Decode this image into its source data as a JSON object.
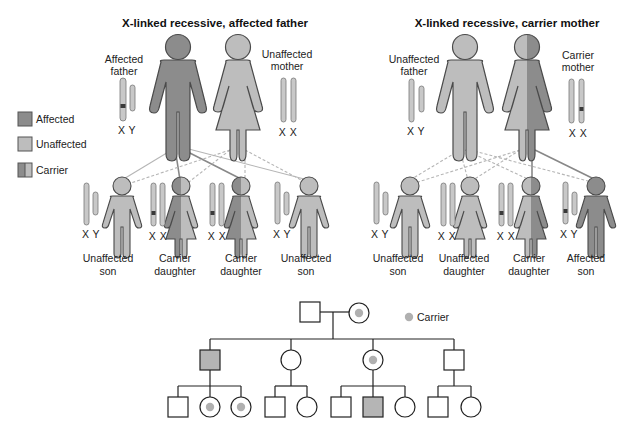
{
  "colors": {
    "affected": "#8c8c8c",
    "unaffected": "#bdbdbd",
    "carrier_dark": "#8c8c8c",
    "carrier_light": "#bdbdbd",
    "outline": "#4a4a4a",
    "chromosome": "#c8c8c8",
    "mutant_band": "#3a3a3a",
    "pedigree_line": "#222222",
    "pedigree_affected": "#b5b5b5",
    "pedigree_carrier_dot": "#b0b0b0"
  },
  "legend": {
    "items": [
      {
        "label": "Affected",
        "type": "affected"
      },
      {
        "label": "Unaffected",
        "type": "unaffected"
      },
      {
        "label": "Carrier",
        "type": "carrier"
      }
    ]
  },
  "panel_left": {
    "title": "X-linked recessive, affected father",
    "father": {
      "label_line1": "Affected",
      "label_line2": "father",
      "chromosomes": "X Y",
      "status": "affected"
    },
    "mother": {
      "label_line1": "Unaffected",
      "label_line2": "mother",
      "chromosomes": "X X",
      "status": "unaffected"
    },
    "children": [
      {
        "label_line1": "Unaffected",
        "label_line2": "son",
        "chromosomes": "X Y",
        "sex": "male",
        "status": "unaffected"
      },
      {
        "label_line1": "Carrier",
        "label_line2": "daughter",
        "chromosomes": "X X",
        "sex": "female",
        "status": "carrier"
      },
      {
        "label_line1": "Carrier",
        "label_line2": "daughter",
        "chromosomes": "X X",
        "sex": "female",
        "status": "carrier"
      },
      {
        "label_line1": "Unaffected",
        "label_line2": "son",
        "chromosomes": "X Y",
        "sex": "male",
        "status": "unaffected"
      }
    ]
  },
  "panel_right": {
    "title": "X-linked recessive, carrier mother",
    "father": {
      "label_line1": "Unaffected",
      "label_line2": "father",
      "chromosomes": "X Y",
      "status": "unaffected"
    },
    "mother": {
      "label_line1": "Carrier",
      "label_line2": "mother",
      "chromosomes": "X X",
      "status": "carrier"
    },
    "children": [
      {
        "label_line1": "Unaffected",
        "label_line2": "son",
        "chromosomes": "X Y",
        "sex": "male",
        "status": "unaffected"
      },
      {
        "label_line1": "Unaffected",
        "label_line2": "daughter",
        "chromosomes": "X X",
        "sex": "female",
        "status": "unaffected"
      },
      {
        "label_line1": "Carrier",
        "label_line2": "daughter",
        "chromosomes": "X X",
        "sex": "female",
        "status": "carrier"
      },
      {
        "label_line1": "Affected",
        "label_line2": "son",
        "chromosomes": "X Y",
        "sex": "male",
        "status": "affected"
      }
    ]
  },
  "pedigree": {
    "legend_label": "Carrier",
    "generation1": [
      {
        "sex": "male",
        "status": "unaffected"
      },
      {
        "sex": "female",
        "status": "carrier"
      }
    ],
    "generation2": [
      {
        "sex": "male",
        "status": "affected"
      },
      {
        "sex": "female",
        "status": "unaffected"
      },
      {
        "sex": "female",
        "status": "carrier"
      },
      {
        "sex": "male",
        "status": "unaffected"
      }
    ],
    "generation3": [
      {
        "parent": 0,
        "sex": "male",
        "status": "unaffected"
      },
      {
        "parent": 0,
        "sex": "female",
        "status": "carrier"
      },
      {
        "parent": 0,
        "sex": "female",
        "status": "carrier"
      },
      {
        "parent": 1,
        "sex": "male",
        "status": "unaffected"
      },
      {
        "parent": 1,
        "sex": "female",
        "status": "unaffected"
      },
      {
        "parent": 2,
        "sex": "male",
        "status": "unaffected"
      },
      {
        "parent": 2,
        "sex": "male",
        "status": "affected"
      },
      {
        "parent": 2,
        "sex": "female",
        "status": "unaffected"
      },
      {
        "parent": 3,
        "sex": "male",
        "status": "unaffected"
      },
      {
        "parent": 3,
        "sex": "female",
        "status": "unaffected"
      }
    ]
  }
}
